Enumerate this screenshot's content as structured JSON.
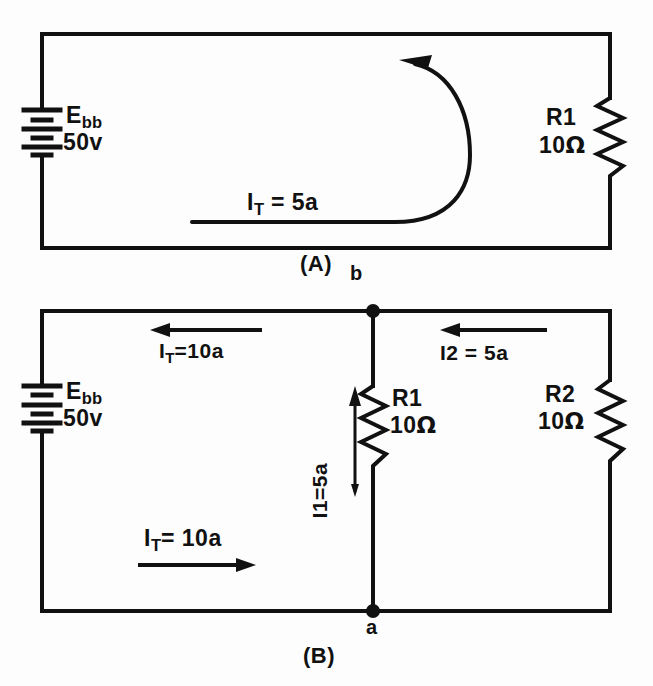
{
  "figure": {
    "background_color": "#fdfdfd",
    "ink_color": "#111111"
  },
  "circuit_a": {
    "caption": "(A)",
    "node_label_b": "b",
    "source": {
      "name": "E",
      "name_sub": "bb",
      "value": "50v",
      "symbol": "battery-icon"
    },
    "resistor": {
      "name": "R1",
      "value": "10",
      "unit": "Ω",
      "symbol": "resistor-zigzag-icon"
    },
    "current": {
      "name": "I",
      "name_sub": "T",
      "equals": "=",
      "value": "5a",
      "text": "I_T = 5a",
      "arrow": "curved-arrow-counterclockwise"
    }
  },
  "circuit_b": {
    "caption": "(B)",
    "node_label_a": "a",
    "source": {
      "name": "E",
      "name_sub": "bb",
      "value": "50v",
      "symbol": "battery-icon"
    },
    "resistor1": {
      "name": "R1",
      "value": "10",
      "unit": "Ω",
      "symbol": "resistor-zigzag-icon"
    },
    "resistor2": {
      "name": "R2",
      "value": "10",
      "unit": "Ω",
      "symbol": "resistor-zigzag-icon"
    },
    "current_total_top": {
      "name": "I",
      "name_sub": "T",
      "equals": "=",
      "value": "10a",
      "text": "I_T = 10a",
      "arrow": "straight-arrow-left"
    },
    "current_total_bottom": {
      "name": "I",
      "name_sub": "T",
      "equals": "=",
      "value": "10a",
      "text": "I_T = 10a",
      "arrow": "straight-arrow-right"
    },
    "current_branch1": {
      "text": "I1=5a",
      "value": "5a",
      "arrow": "straight-arrow-up"
    },
    "current_branch2": {
      "text": "I2 = 5a",
      "value": "5a",
      "arrow": "straight-arrow-left"
    }
  }
}
